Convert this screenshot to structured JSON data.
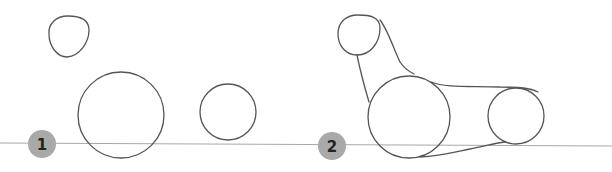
{
  "figure": {
    "colors": {
      "stroke": "#555555",
      "ground_line": "#a8a8a8",
      "badge_fill": "#a9a9a9",
      "badge_text": "#222222"
    },
    "steps": [
      {
        "label": "1"
      },
      {
        "label": "2"
      }
    ]
  }
}
